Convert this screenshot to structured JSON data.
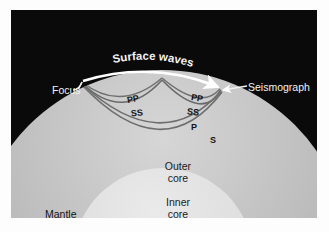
{
  "figure": {
    "kind": "earth-cross-section-seismic-wave-diagram",
    "panel_background": "#0a0a0a",
    "page_background": "#ffffff"
  },
  "layers": [
    {
      "id": "mantle",
      "label": "Mantle",
      "fill": "#b9b9b9"
    },
    {
      "id": "outer_core",
      "label_line1": "Outer",
      "label_line2": "core",
      "fill": "#dcdcdc"
    },
    {
      "id": "inner_core",
      "label_line1": "Inner",
      "label_line2": "core",
      "fill": "#f6f6f6"
    }
  ],
  "annotations": {
    "focus": "Focus",
    "seismograph": "Seismograph",
    "surface_waves": "Surface waves",
    "mantle": "Mantle",
    "outer_core_line1": "Outer",
    "outer_core_line2": "core",
    "inner_core_line1": "Inner",
    "inner_core_line2": "core"
  },
  "wave_labels": {
    "pp_left": "PP",
    "ss_left": "SS",
    "pp_right": "PP",
    "ss_right": "SS",
    "p": "P",
    "s": "S"
  },
  "surface_wave_text_letters": [
    "S",
    "u",
    "r",
    "f",
    "a",
    "c",
    "e",
    " ",
    "w",
    "a",
    "v",
    "e",
    "s"
  ],
  "colors": {
    "surface_wave_stroke": "#ffffff",
    "body_wave_stroke": "#6f6f6f",
    "label_dark": "#141414",
    "label_light": "#f2f2f2"
  }
}
